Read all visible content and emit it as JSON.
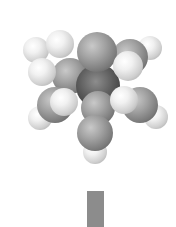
{
  "image": {
    "subject": "space-filling molecular model",
    "palette": "grayscale",
    "background": "#ffffff",
    "atom_colors": {
      "hydrogen": "#e8e8e8",
      "carbon": "#9a9a9a",
      "shadow": "#3a3a3a"
    }
  },
  "atoms": [
    {
      "type": "h",
      "x": 36,
      "y": 50,
      "r": 13
    },
    {
      "type": "h",
      "x": 150,
      "y": 48,
      "r": 12
    },
    {
      "type": "c",
      "x": 130,
      "y": 57,
      "r": 18
    },
    {
      "type": "h",
      "x": 60,
      "y": 44,
      "r": 14
    },
    {
      "type": "c",
      "x": 70,
      "y": 76,
      "r": 18
    },
    {
      "type": "d",
      "x": 98,
      "y": 86,
      "r": 22
    },
    {
      "type": "c",
      "x": 97,
      "y": 52,
      "r": 20
    },
    {
      "type": "h",
      "x": 128,
      "y": 66,
      "r": 15
    },
    {
      "type": "h",
      "x": 42,
      "y": 72,
      "r": 14
    },
    {
      "type": "h",
      "x": 40,
      "y": 118,
      "r": 12
    },
    {
      "type": "h",
      "x": 156,
      "y": 117,
      "r": 12
    },
    {
      "type": "c",
      "x": 55,
      "y": 105,
      "r": 18
    },
    {
      "type": "c",
      "x": 140,
      "y": 105,
      "r": 18
    },
    {
      "type": "c",
      "x": 98,
      "y": 108,
      "r": 17
    },
    {
      "type": "h",
      "x": 64,
      "y": 102,
      "r": 14
    },
    {
      "type": "h",
      "x": 124,
      "y": 100,
      "r": 14
    },
    {
      "type": "h",
      "x": 95,
      "y": 152,
      "r": 12
    },
    {
      "type": "c",
      "x": 95,
      "y": 133,
      "r": 18
    }
  ],
  "bar": {
    "color": "#8c8c8c"
  }
}
